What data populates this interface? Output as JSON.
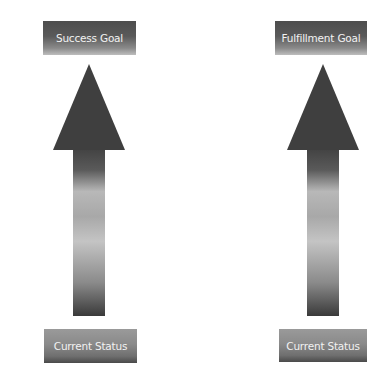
{
  "diagram": {
    "type": "upward-progress-arrows",
    "columns": [
      {
        "goal_label": "Success Goal",
        "status_label": "Current Status",
        "arrow_direction": "up"
      },
      {
        "goal_label": "Fulfillment Goal",
        "status_label": "Current Status",
        "arrow_direction": "up"
      }
    ],
    "colors": {
      "background": "#ffffff",
      "arrow_head": "#3f3f3f",
      "arrow_shaft_top": "#444444",
      "arrow_shaft_mid": "#bdbdbd",
      "arrow_shaft_bottom": "#3a3a3a",
      "label_text": "#f2f2f2"
    }
  }
}
